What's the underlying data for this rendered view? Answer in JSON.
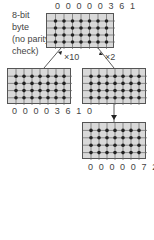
{
  "description": {
    "line1": "8-bit",
    "line2": "byte",
    "line3": "(no parity",
    "line4": "check)"
  },
  "grids": {
    "top": {
      "value": "0 0 0 0 0 3 6 1",
      "cols": 8,
      "rows": 5
    },
    "left": {
      "value": "0 0 0 0 3 6 1 0",
      "cols": 8,
      "rows": 5
    },
    "right": {
      "value": "",
      "cols": 8,
      "rows": 5
    },
    "bottom": {
      "value": "0 0 0 0 0 7 2 2",
      "cols": 8,
      "rows": 5
    }
  },
  "arrows": {
    "left_label": "×10",
    "right_label": "×2"
  },
  "colors": {
    "grid_fill": "#d9d9d9",
    "grid_line": "#555555",
    "dot": "#222222"
  }
}
